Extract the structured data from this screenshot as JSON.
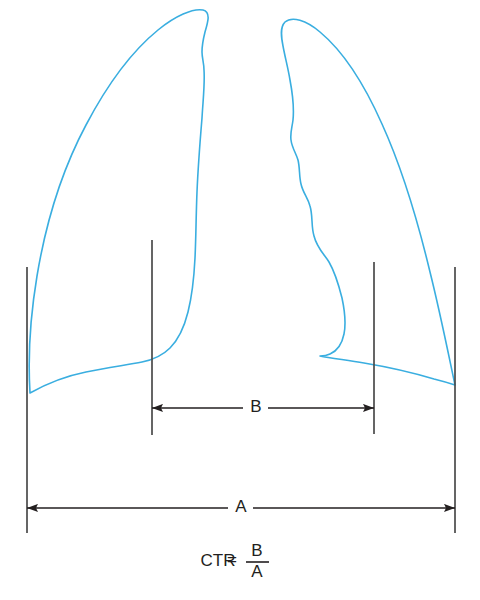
{
  "figure": {
    "type": "medical-line-diagram",
    "background_color": "#ffffff",
    "outline_color": "#3aaee0",
    "measurement_color": "#231f20"
  },
  "labels": {
    "cardiac_width": "B",
    "thoracic_width": "A"
  },
  "formula": {
    "name": "CTR",
    "equals": "=",
    "numerator": "B",
    "denominator": "A",
    "full_text": "CTR = B / A"
  },
  "dimensions": {
    "cardiac": {
      "label": "B",
      "y": 408,
      "x_start": 152,
      "x_end": 374
    },
    "thoracic": {
      "label": "A",
      "y": 508,
      "x_start": 27,
      "x_end": 455
    }
  },
  "reference_lines": [
    {
      "name": "left-thoracic-border",
      "x": 27,
      "y1": 267,
      "y2": 533
    },
    {
      "name": "left-cardiac-border",
      "x": 152,
      "y1": 240,
      "y2": 435
    },
    {
      "name": "right-cardiac-border",
      "x": 374,
      "y1": 262,
      "y2": 434
    },
    {
      "name": "right-thoracic-border",
      "x": 455,
      "y1": 267,
      "y2": 533
    }
  ]
}
